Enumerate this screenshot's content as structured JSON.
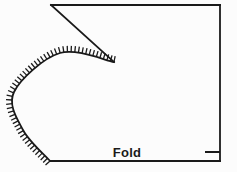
{
  "figure": {
    "background_color": "#fcfcfc",
    "line_color": "#1a1a1a",
    "width": 237,
    "height": 172
  },
  "labels": {
    "fold": "Fold",
    "fold_x": 127,
    "fold_y": 157
  },
  "chart_data": {
    "type": "diagram",
    "xlabel": "",
    "ylabel": "",
    "xlim": [
      0,
      237
    ],
    "ylim": [
      0,
      172
    ],
    "grid": false,
    "legend": "none",
    "annotations": [
      {
        "name": "fold",
        "text": "Fold",
        "x": 127,
        "y": 157
      }
    ],
    "elements": [
      {
        "name": "top-edge",
        "kind": "polyline",
        "points": [
          [
            51,
            5
          ],
          [
            220,
            5
          ]
        ],
        "stroke_width": 1.8
      },
      {
        "name": "right-edge",
        "kind": "polyline",
        "points": [
          [
            220,
            5
          ],
          [
            220,
            161
          ]
        ],
        "stroke_width": 1.8
      },
      {
        "name": "bottom-fold-edge",
        "kind": "polyline",
        "points": [
          [
            220,
            161
          ],
          [
            50,
            161
          ]
        ],
        "stroke_width": 1.8
      },
      {
        "name": "diagonal-cut-line",
        "kind": "polyline",
        "points": [
          [
            51,
            5
          ],
          [
            114,
            62
          ]
        ],
        "stroke_width": 1.8
      },
      {
        "name": "notch-tick",
        "kind": "polyline",
        "points": [
          [
            205,
            152
          ],
          [
            220,
            152
          ]
        ],
        "stroke_width": 2.0
      },
      {
        "name": "hatched-seam-curve",
        "kind": "bezier-curve",
        "points": [
          [
            114,
            62
          ],
          [
            60,
            53
          ],
          [
            14,
            92
          ],
          [
            23,
            130
          ],
          [
            50,
            161
          ]
        ],
        "stroke_width": 1.8,
        "hatch_side": "outer",
        "hatch_count": 54,
        "hatch_length": 6
      }
    ]
  }
}
